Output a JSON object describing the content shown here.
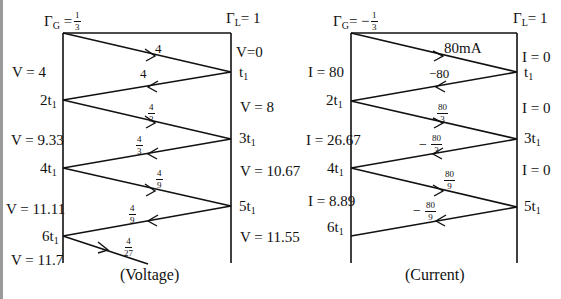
{
  "voltage_diagram": {
    "caption": "(Voltage)",
    "gamma_g": {
      "symbol": "Γ",
      "sub": "G",
      "eq": " = ",
      "num": "1",
      "den": "3"
    },
    "gamma_l": {
      "symbol": "Γ",
      "sub": "L",
      "eq": "= 1"
    },
    "left_labels": [
      {
        "text": "V = 4"
      },
      {
        "text": "V = 9.33"
      },
      {
        "text": "V = 11.11"
      },
      {
        "text": "V = 11.7"
      }
    ],
    "right_labels": [
      {
        "text": "V=0"
      },
      {
        "text": "V = 8"
      },
      {
        "text": "V = 10.67"
      },
      {
        "text": "V = 11.55"
      }
    ],
    "time_marks_left": [
      "2t",
      "4t",
      "6t"
    ],
    "time_marks_right": [
      "t",
      "3t",
      "5t"
    ],
    "time_sub": "1",
    "wave_labels": [
      {
        "text": "4"
      },
      {
        "text": "4"
      },
      {
        "num": "4",
        "den": "3"
      },
      {
        "num": "4",
        "den": "3"
      },
      {
        "num": "4",
        "den": "9"
      },
      {
        "num": "4",
        "den": "9"
      },
      {
        "num": "4",
        "den": "27"
      }
    ]
  },
  "current_diagram": {
    "caption": "(Current)",
    "gamma_g": {
      "symbol": "Γ",
      "sub": "G",
      "eq": "= −",
      "num": "1",
      "den": "3"
    },
    "gamma_l": {
      "symbol": "Γ",
      "sub": "L",
      "eq": "= 1"
    },
    "left_labels": [
      {
        "text": "I = 80"
      },
      {
        "text": "I = 26.67"
      },
      {
        "text": "I = 8.89"
      }
    ],
    "right_labels": [
      {
        "text": "I = 0"
      },
      {
        "text": "I = 0"
      },
      {
        "text": "I = 0"
      }
    ],
    "time_marks_left": [
      "2t",
      "4t",
      "6t"
    ],
    "time_marks_right": [
      "t",
      "3t",
      "5t"
    ],
    "time_sub": "1",
    "wave_labels": [
      {
        "text": "80mA"
      },
      {
        "text": "−80"
      },
      {
        "num": "80",
        "den": "3"
      },
      {
        "sign": "−",
        "num": "80",
        "den": "3"
      },
      {
        "num": "80",
        "den": "9"
      },
      {
        "sign": "−",
        "num": "80",
        "den": "9"
      }
    ]
  }
}
